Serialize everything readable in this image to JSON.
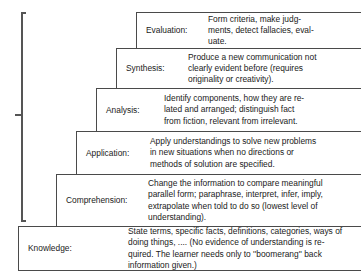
{
  "diagram": {
    "brace": {
      "name": "grouping-brace",
      "spans_levels": [
        "Comprehension",
        "Application",
        "Analysis",
        "Synthesis",
        "Evaluation"
      ]
    },
    "levels": [
      {
        "id": "evaluation",
        "label": "Evaluation:",
        "description": "Form criteria, make judg-\nments, detect fallacies, eval-\nuate."
      },
      {
        "id": "synthesis",
        "label": "Synthesis:",
        "description": "Produce a new communication not\nclearly evident before (requires\noriginality or creativity)."
      },
      {
        "id": "analysis",
        "label": "Analysis:",
        "description": "Identify components, how they are re-\nlated and arranged; distinguish fact\nfrom fiction, relevant from irrelevant."
      },
      {
        "id": "application",
        "label": "Application:",
        "description": "Apply understandings to solve new problems\nin new situations when no directions or\nmethods of solution are specified."
      },
      {
        "id": "comprehension",
        "label": "Comprehension:",
        "description": "Change the information to compare meaningful\nparallel form; paraphrase, interpret, infer, imply,\nextrapolate when told to do so (lowest level of\nunderstanding)."
      },
      {
        "id": "knowledge",
        "label": "Knowledge:",
        "description": "State terms, specific facts, definitions, categories, ways of\ndoing things, .... (No evidence of understanding is re-\nquired.  The learner needs only to ''boomerang'' back\ninformation given.)"
      }
    ]
  }
}
